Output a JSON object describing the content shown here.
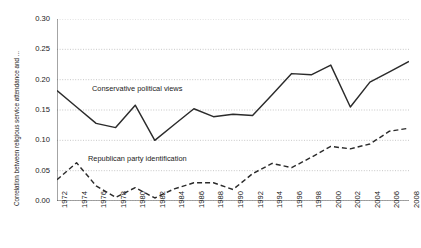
{
  "chart_data": {
    "type": "line",
    "title": "",
    "xlabel": "",
    "ylabel": "Correlation between religious service attendance and ...",
    "xlim": [
      1972,
      2008
    ],
    "ylim": [
      0.0,
      0.3
    ],
    "ytick_step": 0.05,
    "xtick_step": 2,
    "grid": "horizontal-dotted",
    "legend": "inline-annotations",
    "xticks": [
      "1972",
      "1974",
      "1976",
      "1978",
      "1980",
      "1982",
      "1984",
      "1986",
      "1988",
      "1990",
      "1992",
      "1994",
      "1996",
      "1998",
      "2000",
      "2002",
      "2004",
      "2006",
      "2008"
    ],
    "yticks": [
      "0.00",
      "0.05",
      "0.10",
      "0.15",
      "0.20",
      "0.25",
      "0.30"
    ],
    "x": [
      1972,
      1974,
      1976,
      1978,
      1980,
      1982,
      1984,
      1986,
      1988,
      1990,
      1992,
      1994,
      1996,
      1998,
      2000,
      2002,
      2004,
      2006,
      2008
    ],
    "series": [
      {
        "name": "Conservative political views",
        "style": "solid",
        "color": "#2b2b2b",
        "x": [
          1972,
          1974,
          1976,
          1978,
          1980,
          1982,
          1984,
          1986,
          1988,
          1990,
          1992,
          1994,
          1996,
          1998,
          2000,
          2002,
          2004,
          2006,
          2008
        ],
        "values": [
          0.182,
          0.155,
          0.128,
          0.121,
          0.158,
          0.1,
          0.126,
          0.152,
          0.139,
          0.143,
          0.141,
          0.175,
          0.21,
          0.208,
          0.224,
          0.155,
          0.196,
          0.213,
          0.23
        ]
      },
      {
        "name": "Republican party identification",
        "style": "dashed",
        "color": "#2b2b2b",
        "x": [
          1972,
          1974,
          1976,
          1978,
          1980,
          1982,
          1984,
          1986,
          1988,
          1990,
          1992,
          1994,
          1996,
          1998,
          2000,
          2002,
          2004,
          2006,
          2008
        ],
        "values": [
          0.035,
          0.063,
          0.025,
          0.006,
          0.022,
          0.005,
          0.02,
          0.03,
          0.03,
          0.019,
          0.045,
          0.062,
          0.055,
          0.072,
          0.09,
          0.086,
          0.094,
          0.115,
          0.12
        ]
      }
    ],
    "annotations": [
      {
        "text": "Conservative political views",
        "series": "Conservative political views"
      },
      {
        "text": "Republican party identification",
        "series": "Republican party identification"
      }
    ]
  },
  "figure": {
    "caption": ""
  }
}
